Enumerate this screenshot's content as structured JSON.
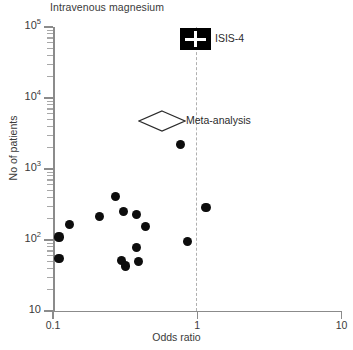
{
  "chart_data": {
    "type": "scatter",
    "title": "Intravenous magnesium",
    "xlabel": "Odds ratio",
    "ylabel": "No of patients",
    "xscale": "log",
    "yscale": "log",
    "xlim": [
      0.1,
      10
    ],
    "ylim": [
      10,
      100000
    ],
    "grid": false,
    "legend": "none",
    "x_ticks": [
      {
        "value": 0.1,
        "label": "0.1"
      },
      {
        "value": 1,
        "label": "1"
      },
      {
        "value": 10,
        "label": "10"
      }
    ],
    "y_ticks": [
      {
        "value": 100000,
        "label": "10",
        "exponent": "5"
      },
      {
        "value": 10000,
        "label": "10",
        "exponent": "4"
      },
      {
        "value": 1000,
        "label": "10",
        "exponent": "3"
      },
      {
        "value": 100,
        "label": "10",
        "exponent": "2"
      },
      {
        "value": 10,
        "label": "10",
        "exponent": ""
      }
    ],
    "reference_line": {
      "x": 1,
      "style": "dashed",
      "color": "#b0b0b0"
    },
    "series": [
      {
        "name": "Individual trials",
        "marker": "filled-circle",
        "color": "#0d0d0d",
        "points": [
          {
            "odds_ratio": 0.11,
            "patients": 110
          },
          {
            "odds_ratio": 0.11,
            "patients": 55
          },
          {
            "odds_ratio": 0.13,
            "patients": 165
          },
          {
            "odds_ratio": 0.21,
            "patients": 215
          },
          {
            "odds_ratio": 0.27,
            "patients": 410
          },
          {
            "odds_ratio": 0.3,
            "patients": 52
          },
          {
            "odds_ratio": 0.31,
            "patients": 250
          },
          {
            "odds_ratio": 0.32,
            "patients": 43
          },
          {
            "odds_ratio": 0.38,
            "patients": 228
          },
          {
            "odds_ratio": 0.38,
            "patients": 78
          },
          {
            "odds_ratio": 0.39,
            "patients": 50
          },
          {
            "odds_ratio": 0.44,
            "patients": 155
          },
          {
            "odds_ratio": 0.77,
            "patients": 2200
          },
          {
            "odds_ratio": 0.86,
            "patients": 95
          },
          {
            "odds_ratio": 1.15,
            "patients": 290
          }
        ]
      }
    ],
    "annotations": [
      {
        "label": "ISIS-4",
        "marker": "black-square-with-white-cross",
        "odds_ratio": 1.0,
        "patients": 58000
      },
      {
        "label": "Meta-analysis",
        "marker": "open-diamond",
        "odds_ratio": 0.53,
        "patients": 4600
      }
    ]
  }
}
